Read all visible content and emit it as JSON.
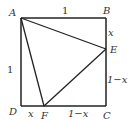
{
  "diagram": {
    "type": "geometry",
    "points": {
      "A": {
        "label": "A",
        "x": 21,
        "y": 18
      },
      "B": {
        "label": "B",
        "x": 106,
        "y": 18
      },
      "C": {
        "label": "C",
        "x": 106,
        "y": 106
      },
      "D": {
        "label": "D",
        "x": 21,
        "y": 106
      },
      "E": {
        "label": "E",
        "x": 106,
        "y": 49
      },
      "F": {
        "label": "F",
        "x": 44,
        "y": 106
      }
    },
    "segments": [
      [
        "A",
        "B"
      ],
      [
        "B",
        "C"
      ],
      [
        "C",
        "D"
      ],
      [
        "D",
        "A"
      ],
      [
        "A",
        "E"
      ],
      [
        "E",
        "F"
      ],
      [
        "F",
        "A"
      ]
    ],
    "length_labels": {
      "AB": "1",
      "AD": "1",
      "BE": "x",
      "EC": "1−x",
      "DF": "x",
      "FC": "1−x"
    },
    "stroke_color": "#222222"
  }
}
